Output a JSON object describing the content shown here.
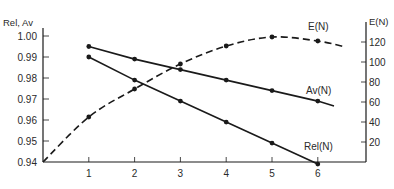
{
  "chart_data": {
    "type": "line",
    "title": "",
    "xlabel": "",
    "ylabel": "Rel, Av",
    "y2label": "E(N)",
    "x": [
      1,
      2,
      3,
      4,
      5,
      6
    ],
    "x_ticks": [
      "1",
      "2",
      "3",
      "4",
      "5",
      "6"
    ],
    "xlim": [
      0,
      7
    ],
    "ylim": [
      0.94,
      1.005
    ],
    "y_ticks": [
      "1.00",
      "0.99",
      "0.98",
      "0.97",
      "0.96",
      "0.95",
      "0.94"
    ],
    "y2lim": [
      0,
      125
    ],
    "y2_ticks": [
      "120",
      "100",
      "80",
      "60",
      "40",
      "20"
    ],
    "grid": false,
    "legend": "inline labels at line ends",
    "series": [
      {
        "name": "Av(N)",
        "axis": "left",
        "style": "solid",
        "x": [
          1,
          2,
          3,
          4,
          5,
          6
        ],
        "values": [
          0.995,
          0.989,
          0.984,
          0.979,
          0.974,
          0.969
        ]
      },
      {
        "name": "Rel(N)",
        "axis": "left",
        "style": "solid",
        "x": [
          1,
          2,
          3,
          4,
          5,
          6
        ],
        "values": [
          0.99,
          0.979,
          0.969,
          0.959,
          0.949,
          0.939
        ]
      },
      {
        "name": "E(N)",
        "axis": "right",
        "style": "dashed",
        "x": [
          0,
          1,
          2,
          3,
          4,
          5,
          6
        ],
        "values": [
          0,
          45,
          73,
          98,
          116,
          125,
          121
        ]
      }
    ]
  },
  "labels": {
    "left_axis_title": "Rel, Av",
    "right_axis_title": "E(N)",
    "series_av": "Av(N)",
    "series_rel": "Rel(N)",
    "series_e": "E(N)"
  },
  "colors": {
    "line": "#1a1a1a",
    "text": "#2a2a2a",
    "background": "#ffffff"
  }
}
